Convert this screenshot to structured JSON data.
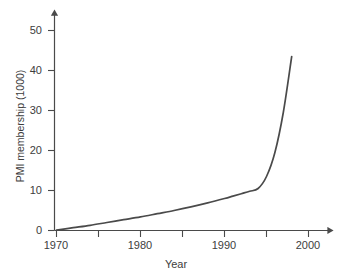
{
  "chart_data": {
    "type": "line",
    "title": "",
    "xlabel": "Year",
    "ylabel": "PMI membership (1000)",
    "xlim": [
      1967.5,
      2002.5
    ],
    "ylim": [
      0,
      54
    ],
    "grid": false,
    "legend": null,
    "axis_style": "arrow-ended L-shaped axes, ticks outside",
    "x_ticks_major": [
      1970,
      1980,
      1990,
      2000
    ],
    "x_ticks_major_labels": [
      "1970",
      "1980",
      "1990",
      "2000"
    ],
    "x_ticks_minor": [
      1975,
      1985,
      1995
    ],
    "y_ticks": [
      0,
      10,
      20,
      30,
      40,
      50
    ],
    "y_tick_labels": [
      "0",
      "10",
      "20",
      "30",
      "40",
      "50"
    ],
    "series": [
      {
        "name": "PMI membership",
        "color": "#4a4a4a",
        "x": [
          1970,
          1972,
          1974,
          1976,
          1978,
          1980,
          1982,
          1984,
          1986,
          1988,
          1990,
          1991,
          1992,
          1993,
          1994,
          1995,
          1996,
          1997,
          1998
        ],
        "values": [
          0.1,
          0.7,
          1.3,
          2.0,
          2.7,
          3.4,
          4.2,
          5.0,
          5.9,
          6.9,
          8.0,
          8.6,
          9.2,
          9.8,
          10.5,
          13.5,
          19.5,
          29.5,
          43.5
        ]
      }
    ]
  },
  "axes": {
    "y_axis_name": "y-axis",
    "x_axis_name": "x-axis"
  }
}
